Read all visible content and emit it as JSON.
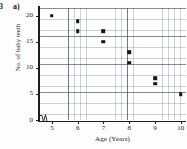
{
  "question": {
    "number": "3",
    "part": "a)"
  },
  "chart_data": {
    "type": "scatter",
    "title": "",
    "xlabel": "Age (Years)",
    "ylabel": "No. of baby teeth",
    "xlim": [
      4.5,
      10.2
    ],
    "ylim": [
      0,
      21.5
    ],
    "xticks": [
      "5",
      "6",
      "7",
      "8",
      "9",
      "10"
    ],
    "xtick_values": [
      5,
      6,
      7,
      8,
      9,
      10
    ],
    "yticks": [
      "0",
      "5",
      "10",
      "15",
      "20"
    ],
    "ytick_values": [
      0,
      5,
      10,
      15,
      20
    ],
    "grid": true,
    "grid_style": "graph-paper, minor 1 unit, major 5 units",
    "axis_break_x": true,
    "legend": false,
    "marker": "filled-square",
    "marker_color": "#151515",
    "points": [
      {
        "x": 5,
        "y": 20
      },
      {
        "x": 6,
        "y": 19
      },
      {
        "x": 6,
        "y": 17
      },
      {
        "x": 7,
        "y": 17
      },
      {
        "x": 7,
        "y": 15
      },
      {
        "x": 8,
        "y": 13
      },
      {
        "x": 8,
        "y": 11
      },
      {
        "x": 9,
        "y": 8
      },
      {
        "x": 9,
        "y": 7
      },
      {
        "x": 10,
        "y": 5
      }
    ]
  }
}
